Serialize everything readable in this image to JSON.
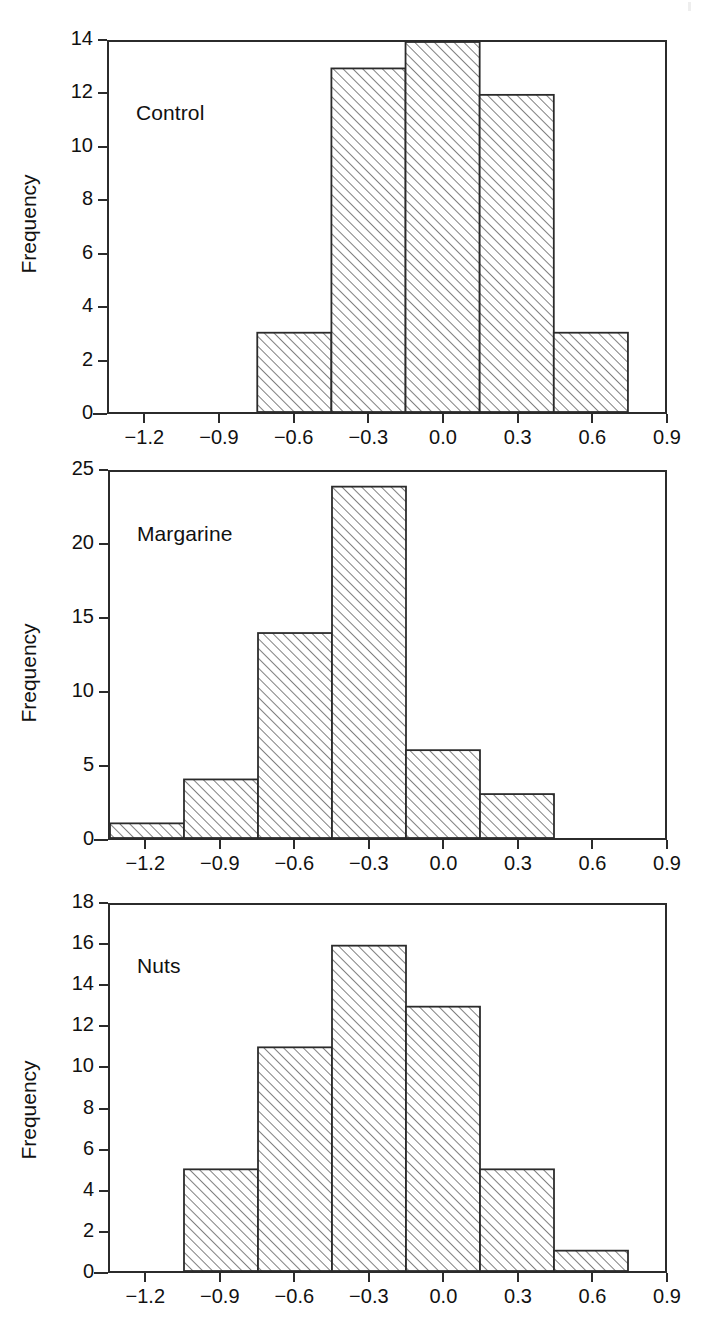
{
  "figure": {
    "width": 718,
    "height": 1326,
    "background": "#ffffff",
    "line_color": "#2b2b2b",
    "text_color": "#111111",
    "hatch_style": "forward-diagonal"
  },
  "chart_data": [
    {
      "type": "bar",
      "title": "Control",
      "xlabel": "",
      "ylabel": "Frequency",
      "bin_edges": [
        -0.75,
        -0.45,
        -0.15,
        0.15,
        0.45,
        0.75
      ],
      "categories": [
        "-0.75 to -0.45",
        "-0.45 to -0.15",
        "-0.15 to 0.15",
        "0.15 to 0.45",
        "0.45 to 0.75"
      ],
      "values": [
        3,
        13,
        14,
        12,
        3
      ],
      "xlim": [
        -1.35,
        0.9
      ],
      "ylim": [
        0,
        14
      ],
      "xticks": [
        -1.2,
        -0.9,
        -0.6,
        -0.3,
        0.0,
        0.3,
        0.6,
        0.9
      ],
      "xticklabels": [
        "−1.2",
        "−0.9",
        "−0.6",
        "−0.3",
        "0.0",
        "0.3",
        "0.6",
        "0.9"
      ],
      "yticks": [
        0,
        2,
        4,
        6,
        8,
        10,
        12,
        14
      ],
      "yticklabels": [
        "0",
        "2",
        "4",
        "6",
        "8",
        "10",
        "12",
        "14"
      ],
      "grid": false,
      "legend": "none"
    },
    {
      "type": "bar",
      "title": "Margarine",
      "xlabel": "",
      "ylabel": "Frequency",
      "bin_edges": [
        -1.35,
        -1.05,
        -0.75,
        -0.45,
        -0.15,
        0.15,
        0.45
      ],
      "categories": [
        "-1.35 to -1.05",
        "-1.05 to -0.75",
        "-0.75 to -0.45",
        "-0.45 to -0.15",
        "-0.15 to 0.15",
        "0.15 to 0.45"
      ],
      "values": [
        1,
        4,
        14,
        24,
        6,
        3
      ],
      "xlim": [
        -1.35,
        0.9
      ],
      "ylim": [
        0,
        25
      ],
      "xticks": [
        -1.2,
        -0.9,
        -0.6,
        -0.3,
        0.0,
        0.3,
        0.6,
        0.9
      ],
      "xticklabels": [
        "−1.2",
        "−0.9",
        "−0.6",
        "−0.3",
        "0.0",
        "0.3",
        "0.6",
        "0.9"
      ],
      "yticks": [
        0,
        5,
        10,
        15,
        20,
        25
      ],
      "yticklabels": [
        "0",
        "5",
        "10",
        "15",
        "20",
        "25"
      ],
      "grid": false,
      "legend": "none"
    },
    {
      "type": "bar",
      "title": "Nuts",
      "xlabel": "",
      "ylabel": "Frequency",
      "bin_edges": [
        -1.05,
        -0.75,
        -0.45,
        -0.15,
        0.15,
        0.45,
        0.75
      ],
      "categories": [
        "-1.05 to -0.75",
        "-0.75 to -0.45",
        "-0.45 to -0.15",
        "-0.15 to 0.15",
        "0.15 to 0.45",
        "0.45 to 0.75"
      ],
      "values": [
        5,
        11,
        16,
        13,
        5,
        1
      ],
      "xlim": [
        -1.35,
        0.9
      ],
      "ylim": [
        0,
        18
      ],
      "xticks": [
        -1.2,
        -0.9,
        -0.6,
        -0.3,
        0.0,
        0.3,
        0.6,
        0.9
      ],
      "xticklabels": [
        "−1.2",
        "−0.9",
        "−0.6",
        "−0.3",
        "0.0",
        "0.3",
        "0.6",
        "0.9"
      ],
      "yticks": [
        0,
        2,
        4,
        6,
        8,
        10,
        12,
        14,
        16,
        18
      ],
      "yticklabels": [
        "0",
        "2",
        "4",
        "6",
        "8",
        "10",
        "12",
        "14",
        "16",
        "18"
      ],
      "grid": false,
      "legend": "none"
    }
  ],
  "panels": [
    {
      "label": "Control",
      "ylabel": "Frequency"
    },
    {
      "label": "Margarine",
      "ylabel": "Frequency"
    },
    {
      "label": "Nuts",
      "ylabel": "Frequency"
    }
  ]
}
